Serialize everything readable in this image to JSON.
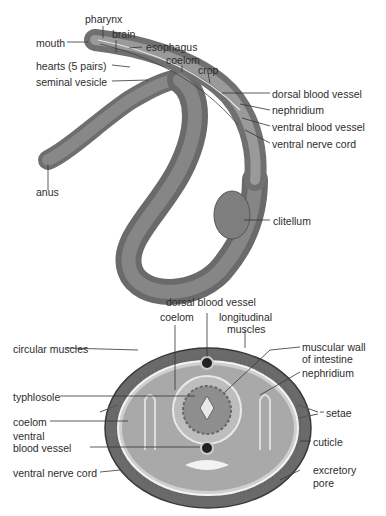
{
  "whole_worm": {
    "labels": {
      "pharynx": "pharynx",
      "mouth": "mouth",
      "brain": "brain",
      "esophagus": "esophagus",
      "hearts": "hearts (5 pairs)",
      "coelom": "coelom",
      "crop": "crop",
      "seminal_vesicle": "seminal vesicle",
      "dorsal_blood_vessel": "dorsal blood vessel",
      "nephridium": "nephridium",
      "ventral_blood_vessel": "ventral blood vessel",
      "ventral_nerve_cord": "ventral nerve cord",
      "anus": "anus",
      "clitellum": "clitellum"
    }
  },
  "cross_section": {
    "labels": {
      "dorsal_blood_vessel": "dorsal blood vessel",
      "coelom_top": "coelom",
      "longitudinal_muscles_1": "longitudinal",
      "longitudinal_muscles_2": "muscles",
      "circular_muscles": "circular muscles",
      "muscular_wall_1": "muscular wall",
      "muscular_wall_2": "of intestine",
      "typhlosole": "typhlosole",
      "nephridium": "nephridium",
      "coelom_left": "coelom",
      "setae": "setae",
      "ventral_blood_vessel_1": "ventral",
      "ventral_blood_vessel_2": "blood vessel",
      "cuticle": "cuticle",
      "ventral_nerve_cord": "ventral nerve cord",
      "excretory_pore_1": "excretory",
      "excretory_pore_2": "pore"
    }
  }
}
